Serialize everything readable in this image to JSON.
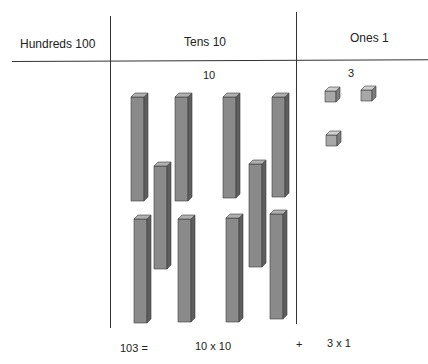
{
  "headers": {
    "hundreds": "Hundreds 100",
    "tens": "Tens 10",
    "ones": "Ones 1"
  },
  "counts": {
    "tens": "10",
    "ones": "3"
  },
  "equation": {
    "total": "103 =",
    "tens_term": "10 x 10",
    "plus": "+",
    "ones_term": "3 x 1"
  },
  "colors": {
    "rod_front": "#8a8a8a",
    "rod_side": "#5e5e5e",
    "rod_top": "#b0b0b0",
    "cube_front": "#a8a8a8",
    "cube_side": "#7c7c7c",
    "cube_top": "#cfcfcf",
    "line": "#333333"
  },
  "blocks": {
    "ten_rods": [
      {
        "x": 131,
        "y": 97,
        "w": 13,
        "h": 104
      },
      {
        "x": 175,
        "y": 97,
        "w": 13,
        "h": 104
      },
      {
        "x": 223,
        "y": 97,
        "w": 13,
        "h": 101
      },
      {
        "x": 272,
        "y": 97,
        "w": 13,
        "h": 100
      },
      {
        "x": 154,
        "y": 166,
        "w": 13,
        "h": 103
      },
      {
        "x": 249,
        "y": 164,
        "w": 13,
        "h": 103
      },
      {
        "x": 134,
        "y": 219,
        "w": 13,
        "h": 104
      },
      {
        "x": 178,
        "y": 219,
        "w": 13,
        "h": 103
      },
      {
        "x": 226,
        "y": 218,
        "w": 13,
        "h": 104
      },
      {
        "x": 270,
        "y": 214,
        "w": 13,
        "h": 105
      }
    ],
    "unit_cubes": [
      {
        "x": 325,
        "y": 91,
        "s": 11
      },
      {
        "x": 361,
        "y": 90,
        "s": 11
      },
      {
        "x": 326,
        "y": 135,
        "s": 11
      }
    ]
  }
}
